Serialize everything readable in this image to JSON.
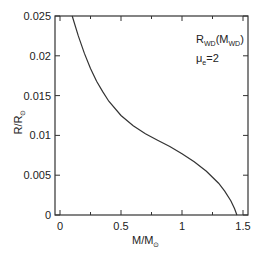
{
  "chart_data": {
    "type": "line",
    "title": "",
    "xlabel": "M/M⊙",
    "ylabel": "R/R⊙",
    "xlim": [
      -0.05,
      1.55
    ],
    "ylim": [
      0,
      0.025
    ],
    "grid": false,
    "legend": "none",
    "x_ticks": [
      "0",
      "0.5",
      "1",
      "1.5"
    ],
    "y_ticks": [
      "0",
      "0.005",
      "0.01",
      "0.015",
      "0.02",
      "0.025"
    ],
    "annotations": [
      {
        "text": "R_WD(M_WD)",
        "position": "top-right"
      },
      {
        "text": "μ_e=2",
        "position": "top-right"
      }
    ],
    "series": [
      {
        "name": "R_WD(M_WD)",
        "x": [
          0.1,
          0.15,
          0.2,
          0.25,
          0.3,
          0.35,
          0.4,
          0.5,
          0.6,
          0.7,
          0.8,
          0.9,
          1.0,
          1.1,
          1.2,
          1.3,
          1.35,
          1.4,
          1.43,
          1.45
        ],
        "y": [
          0.025,
          0.0225,
          0.0203,
          0.0184,
          0.0168,
          0.0155,
          0.0143,
          0.0125,
          0.0112,
          0.0102,
          0.0094,
          0.0086,
          0.0077,
          0.0067,
          0.0055,
          0.004,
          0.003,
          0.0018,
          0.0008,
          0.0
        ]
      }
    ]
  },
  "labels": {
    "xlabel_main": "M/M",
    "xlabel_sub": "⊙",
    "ylabel_main": "R/R",
    "ylabel_sub": "⊙",
    "anno1_main": "R",
    "anno1_sub1": "WD",
    "anno1_mid": "(M",
    "anno1_sub2": "WD",
    "anno1_end": ")",
    "anno2_main": "μ",
    "anno2_sub": "e",
    "anno2_end": "=2"
  }
}
